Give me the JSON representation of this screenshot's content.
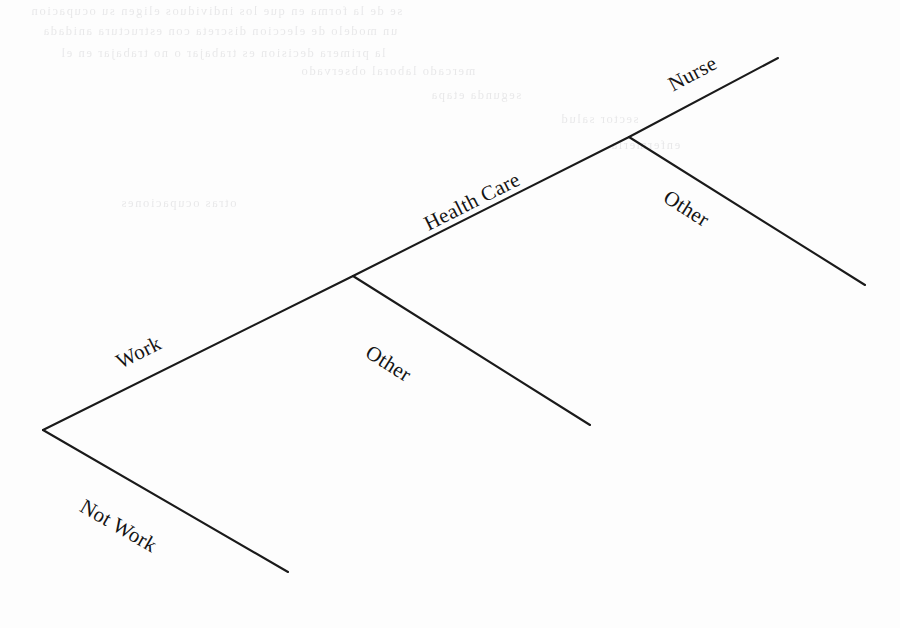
{
  "diagram": {
    "type": "binary-decision-tree",
    "background_color": "#fdfdfd",
    "line_color": "#1a1a1a",
    "text_color": "#141414"
  },
  "nodes": {
    "root": {
      "x": 43,
      "y": 430
    },
    "work": {
      "x": 353,
      "y": 276
    },
    "health_care": {
      "x": 629,
      "y": 137
    }
  },
  "branches": [
    {
      "id": "work",
      "label": "Work",
      "from": {
        "x": 43,
        "y": 430
      },
      "to": {
        "x": 353,
        "y": 276
      },
      "label_x": 112,
      "label_y": 352,
      "label_rotation": -26.4
    },
    {
      "id": "not-work",
      "label": "Not Work",
      "from": {
        "x": 43,
        "y": 430
      },
      "to": {
        "x": 288,
        "y": 572
      },
      "label_x": 88,
      "label_y": 494,
      "label_rotation": 30.1
    },
    {
      "id": "health-care",
      "label": "Health Care",
      "from": {
        "x": 353,
        "y": 276
      },
      "to": {
        "x": 629,
        "y": 137
      },
      "label_x": 420,
      "label_y": 214,
      "label_rotation": -26.7
    },
    {
      "id": "work-other",
      "label": "Other",
      "from": {
        "x": 353,
        "y": 276
      },
      "to": {
        "x": 590,
        "y": 425
      },
      "label_x": 374,
      "label_y": 340,
      "label_rotation": 32.2
    },
    {
      "id": "nurse",
      "label": "Nurse",
      "from": {
        "x": 629,
        "y": 137
      },
      "to": {
        "x": 778,
        "y": 58
      },
      "label_x": 664,
      "label_y": 75,
      "label_rotation": -27.9
    },
    {
      "id": "health-care-other",
      "label": "Other",
      "from": {
        "x": 629,
        "y": 137
      },
      "to": {
        "x": 865,
        "y": 285
      },
      "label_x": 672,
      "label_y": 185,
      "label_rotation": 32.1
    }
  ],
  "bleed_through": {
    "note": "faint mirrored ghost text from reverse side of scanned page",
    "rows": [
      {
        "x": 30,
        "y": 4,
        "text": "se de la forma en que los individuos eligen su ocupacion"
      },
      {
        "x": 42,
        "y": 24,
        "text": "un modelo de eleccion discreta con estructura anidada"
      },
      {
        "x": 60,
        "y": 46,
        "text": "la primera decision es trabajar o no trabajar en el"
      },
      {
        "x": 300,
        "y": 64,
        "text": "mercado laboral observado"
      },
      {
        "x": 430,
        "y": 88,
        "text": "segunda etapa"
      },
      {
        "x": 560,
        "y": 112,
        "text": "sector salud"
      },
      {
        "x": 610,
        "y": 138,
        "text": "enfermeria"
      },
      {
        "x": 120,
        "y": 196,
        "text": "otras ocupaciones"
      }
    ]
  }
}
